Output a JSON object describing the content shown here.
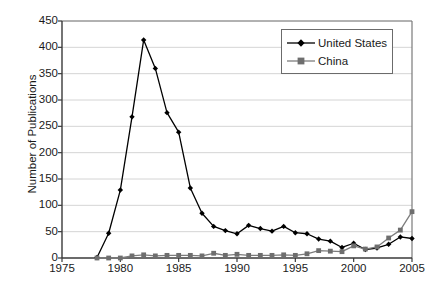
{
  "chart_data": {
    "type": "line",
    "title": "",
    "xlabel": "Year",
    "ylabel": "Number of Publications",
    "xlim": [
      1975,
      2005
    ],
    "ylim": [
      0,
      450
    ],
    "xticks": [
      1975,
      1980,
      1985,
      1990,
      1995,
      2000,
      2005
    ],
    "ytick_labels": [
      "0",
      "50",
      "100",
      "150",
      "200",
      "250",
      "300",
      "350",
      "400",
      "450"
    ],
    "yticks": [
      0,
      50,
      100,
      150,
      200,
      250,
      300,
      350,
      400,
      450
    ],
    "grid": "horizontal",
    "legend_position": "top-right",
    "x": [
      1978,
      1979,
      1980,
      1981,
      1982,
      1983,
      1984,
      1985,
      1986,
      1987,
      1988,
      1989,
      1990,
      1991,
      1992,
      1993,
      1994,
      1995,
      1996,
      1997,
      1998,
      1999,
      2000,
      2001,
      2002,
      2003,
      2004,
      2005
    ],
    "series": [
      {
        "name": "United States",
        "color": "#000000",
        "marker": "diamond",
        "values": [
          1,
          47,
          129,
          268,
          414,
          360,
          276,
          239,
          133,
          85,
          60,
          52,
          46,
          62,
          56,
          51,
          60,
          48,
          46,
          36,
          32,
          20,
          28,
          16,
          19,
          26,
          40,
          37
        ]
      },
      {
        "name": "China",
        "color": "#7d7d7d",
        "marker": "square",
        "values": [
          0,
          0,
          0,
          4,
          6,
          4,
          5,
          5,
          5,
          4,
          9,
          5,
          7,
          5,
          5,
          5,
          6,
          5,
          8,
          14,
          13,
          12,
          23,
          17,
          21,
          38,
          53,
          88
        ]
      }
    ]
  },
  "legend": {
    "entries": [
      {
        "label": "United States"
      },
      {
        "label": "China"
      }
    ]
  }
}
